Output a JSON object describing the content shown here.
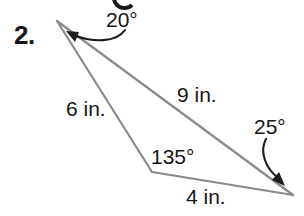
{
  "figure": {
    "type": "triangle-diagram",
    "stroke_color": "#8a8a8a",
    "text_color": "#161616",
    "background_color": "#ffffff",
    "stroke_width": 2,
    "vertices": {
      "a": {
        "name": "top-left-vertex",
        "x": 57,
        "y": 21
      },
      "b": {
        "name": "bottom-middle-vertex",
        "x": 152,
        "y": 172
      },
      "c": {
        "name": "right-vertex",
        "x": 293,
        "y": 195
      }
    },
    "sides": [
      {
        "id": "ab",
        "label": "6 in.",
        "length": 6,
        "unit": "in.",
        "from": "a",
        "to": "b"
      },
      {
        "id": "ac",
        "label": "9 in.",
        "length": 9,
        "unit": "in.",
        "from": "a",
        "to": "c"
      },
      {
        "id": "bc",
        "label": "4 in.",
        "length": 4,
        "unit": "in.",
        "from": "b",
        "to": "c"
      }
    ],
    "angles": [
      {
        "id": "a",
        "label": "20°",
        "measure": 20,
        "at": "a",
        "has_leader_arrow": true
      },
      {
        "id": "b",
        "label": "135°",
        "measure": 135,
        "at": "b",
        "has_leader_arrow": false
      },
      {
        "id": "c",
        "label": "25°",
        "measure": 25,
        "at": "c",
        "has_leader_arrow": true
      }
    ]
  },
  "problem": {
    "number_label": "2."
  }
}
